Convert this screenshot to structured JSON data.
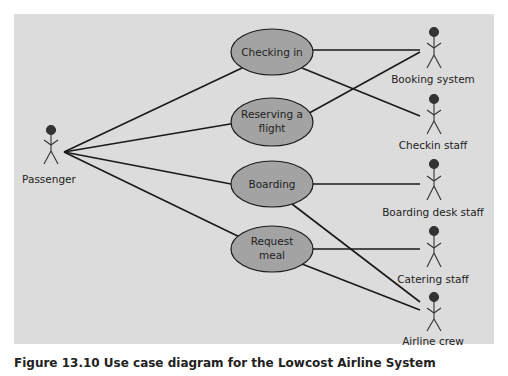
{
  "diagram": {
    "type": "use-case",
    "actors": [
      {
        "id": "passenger",
        "label": "Passenger"
      },
      {
        "id": "booking",
        "label": "Booking system"
      },
      {
        "id": "checkin",
        "label": "Checkin staff"
      },
      {
        "id": "boardingdesk",
        "label": "Boarding desk staff"
      },
      {
        "id": "catering",
        "label": "Catering staff"
      },
      {
        "id": "crew",
        "label": "Airline crew"
      }
    ],
    "use_cases": [
      {
        "id": "checking_in",
        "line1": "Checking in",
        "line2": ""
      },
      {
        "id": "reserving",
        "line1": "Reserving a",
        "line2": "flight"
      },
      {
        "id": "boarding",
        "line1": "Boarding",
        "line2": ""
      },
      {
        "id": "meal",
        "line1": "Request",
        "line2": "meal"
      }
    ],
    "associations": [
      [
        "passenger",
        "checking_in"
      ],
      [
        "passenger",
        "reserving"
      ],
      [
        "passenger",
        "boarding"
      ],
      [
        "passenger",
        "meal"
      ],
      [
        "checking_in",
        "booking"
      ],
      [
        "checking_in",
        "checkin"
      ],
      [
        "reserving",
        "booking"
      ],
      [
        "boarding",
        "boardingdesk"
      ],
      [
        "boarding",
        "crew"
      ],
      [
        "meal",
        "catering"
      ],
      [
        "meal",
        "crew"
      ]
    ],
    "caption": "Figure 13.10  Use case diagram for the Lowcost Airline System"
  },
  "colors": {
    "panel": "#dcdcdc",
    "ellipse_fill": "#a3a3a3",
    "line": "#1a1a1a"
  }
}
